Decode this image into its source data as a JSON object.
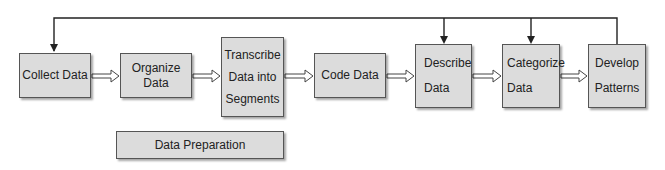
{
  "diagram": {
    "nodes": [
      {
        "id": "collect",
        "lines": [
          "Collect Data"
        ]
      },
      {
        "id": "organize",
        "lines": [
          "Organize",
          "Data"
        ]
      },
      {
        "id": "transcribe",
        "lines": [
          "Transcribe",
          "Data into",
          "Segments"
        ]
      },
      {
        "id": "code",
        "lines": [
          "Code Data"
        ]
      },
      {
        "id": "describe",
        "lines": [
          "Describe",
          "Data"
        ]
      },
      {
        "id": "categorize",
        "lines": [
          "Categorize",
          "Data"
        ]
      },
      {
        "id": "develop",
        "lines": [
          "Develop",
          "Patterns"
        ]
      },
      {
        "id": "prep",
        "lines": [
          "Data Preparation"
        ]
      }
    ],
    "edges": [
      {
        "from": "collect",
        "to": "organize",
        "style": "hollow-arrow"
      },
      {
        "from": "organize",
        "to": "transcribe",
        "style": "hollow-arrow"
      },
      {
        "from": "transcribe",
        "to": "code",
        "style": "hollow-arrow"
      },
      {
        "from": "code",
        "to": "describe",
        "style": "hollow-arrow"
      },
      {
        "from": "describe",
        "to": "categorize",
        "style": "hollow-arrow"
      },
      {
        "from": "categorize",
        "to": "develop",
        "style": "hollow-arrow"
      },
      {
        "from": "develop",
        "to": "collect",
        "style": "feedback-line"
      },
      {
        "from": "develop",
        "to": "describe",
        "style": "feedback-line"
      },
      {
        "from": "develop",
        "to": "categorize",
        "style": "feedback-line"
      }
    ],
    "colors": {
      "box_fill": "#dcdcdc",
      "box_border": "#555555",
      "line": "#222222"
    }
  }
}
